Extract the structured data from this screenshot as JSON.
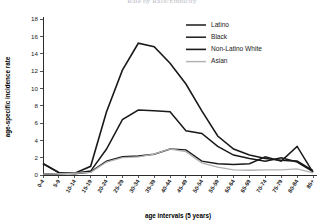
{
  "chart_data": {
    "type": "line",
    "title": "Rate by Race/Ethnicity",
    "xlabel": "age intervals (5 years)",
    "ylabel": "age-specific incidence rate",
    "categories": [
      "0-4",
      "5-9",
      "10-14",
      "15-19",
      "20-24",
      "25-29",
      "30-34",
      "35-39",
      "40-44",
      "45-49",
      "50-54",
      "55-59",
      "60-64",
      "65-69",
      "70-74",
      "75-79",
      "80-84",
      "85+"
    ],
    "ylim": [
      0,
      18
    ],
    "yticks": [
      0,
      2,
      4,
      6,
      8,
      10,
      12,
      14,
      16,
      18
    ],
    "grid": false,
    "legend_position": "top-right",
    "series": [
      {
        "name": "Latino",
        "color": "#1a1a1a",
        "width": 1.5,
        "values": [
          1.3,
          0.25,
          0.2,
          0.45,
          3.0,
          6.4,
          7.5,
          7.4,
          7.3,
          5.1,
          4.8,
          3.3,
          2.3,
          1.9,
          1.6,
          2.0,
          1.5,
          0.4
        ]
      },
      {
        "name": "Black",
        "color": "#1a1a1a",
        "width": 1.5,
        "values": [
          1.35,
          0.3,
          0.15,
          0.35,
          1.6,
          2.1,
          2.2,
          2.4,
          3.0,
          2.9,
          1.6,
          1.3,
          1.2,
          1.3,
          2.1,
          1.6,
          3.3,
          0.3
        ]
      },
      {
        "name": "Non-Latino White",
        "color": "#1a1a1a",
        "width": 1.6,
        "values": [
          0.1,
          0.15,
          0.2,
          1.0,
          7.3,
          12.1,
          15.2,
          14.8,
          12.9,
          10.5,
          7.4,
          4.5,
          3.0,
          2.3,
          1.9,
          1.7,
          1.6,
          0.5
        ]
      },
      {
        "name": "Asian",
        "color": "#b0b0b0",
        "width": 1.3,
        "values": [
          0.1,
          0.15,
          0.2,
          0.3,
          1.5,
          2.0,
          2.1,
          2.4,
          3.0,
          2.7,
          1.4,
          0.9,
          0.6,
          0.55,
          0.6,
          0.6,
          0.7,
          0.25
        ]
      }
    ]
  },
  "legend": {
    "items": [
      {
        "label": "Latino"
      },
      {
        "label": "Black"
      },
      {
        "label": "Non-Latino White"
      },
      {
        "label": "Asian"
      }
    ]
  }
}
